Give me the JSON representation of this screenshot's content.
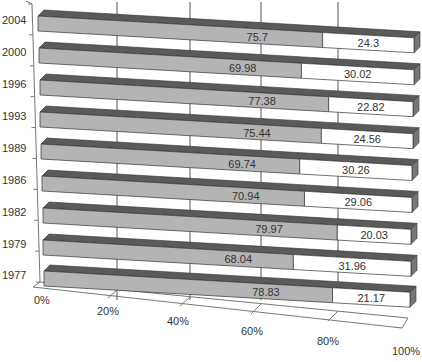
{
  "chart_data": {
    "type": "bar",
    "orientation": "horizontal",
    "stacked": true,
    "percent_stacked": true,
    "three_d": true,
    "title": "",
    "xlabel": "",
    "ylabel": "",
    "xlim": [
      0,
      100
    ],
    "grid": true,
    "legend": "none",
    "categories": [
      "1977",
      "1979",
      "1982",
      "1986",
      "1989",
      "1993",
      "1996",
      "2000",
      "2004"
    ],
    "series": [
      {
        "name": "Series 1",
        "color": "#b4b4b4",
        "values": [
          78.83,
          68.04,
          79.97,
          70.94,
          69.74,
          75.44,
          77.38,
          69.98,
          75.7
        ]
      },
      {
        "name": "Series 2",
        "color": "#ffffff",
        "values": [
          21.17,
          31.96,
          20.03,
          29.06,
          30.26,
          24.56,
          22.82,
          30.02,
          24.3
        ]
      }
    ],
    "x_tick_labels": [
      "0%",
      "20%",
      "40%",
      "60%",
      "80%",
      "100%"
    ]
  },
  "colors": {
    "bar_front_gray": "#b4b4b4",
    "bar_top_dark": "#5a5a5a",
    "bar_front_white": "#ffffff",
    "gridline": "#555555",
    "text": "#333333"
  }
}
